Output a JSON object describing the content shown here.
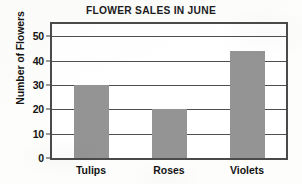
{
  "chart_data": {
    "type": "bar",
    "title": "FLOWER SALES IN JUNE",
    "xlabel": "",
    "ylabel": "Number of Flowers",
    "categories": [
      "Tulips",
      "Roses",
      "Violets"
    ],
    "values": [
      30,
      20,
      44
    ],
    "ylim": [
      0,
      55
    ],
    "yticks": [
      0,
      10,
      20,
      30,
      40,
      50
    ],
    "ytick_labels": [
      "0",
      "10",
      "20",
      "30",
      "40",
      "50"
    ],
    "grid": true,
    "legend": false,
    "bar_color": "#949494",
    "frame_color": "#4a4a4a",
    "gridline_color": "#4f4f4f",
    "text_color": "#141414",
    "background_color": "#fdfdfb"
  }
}
